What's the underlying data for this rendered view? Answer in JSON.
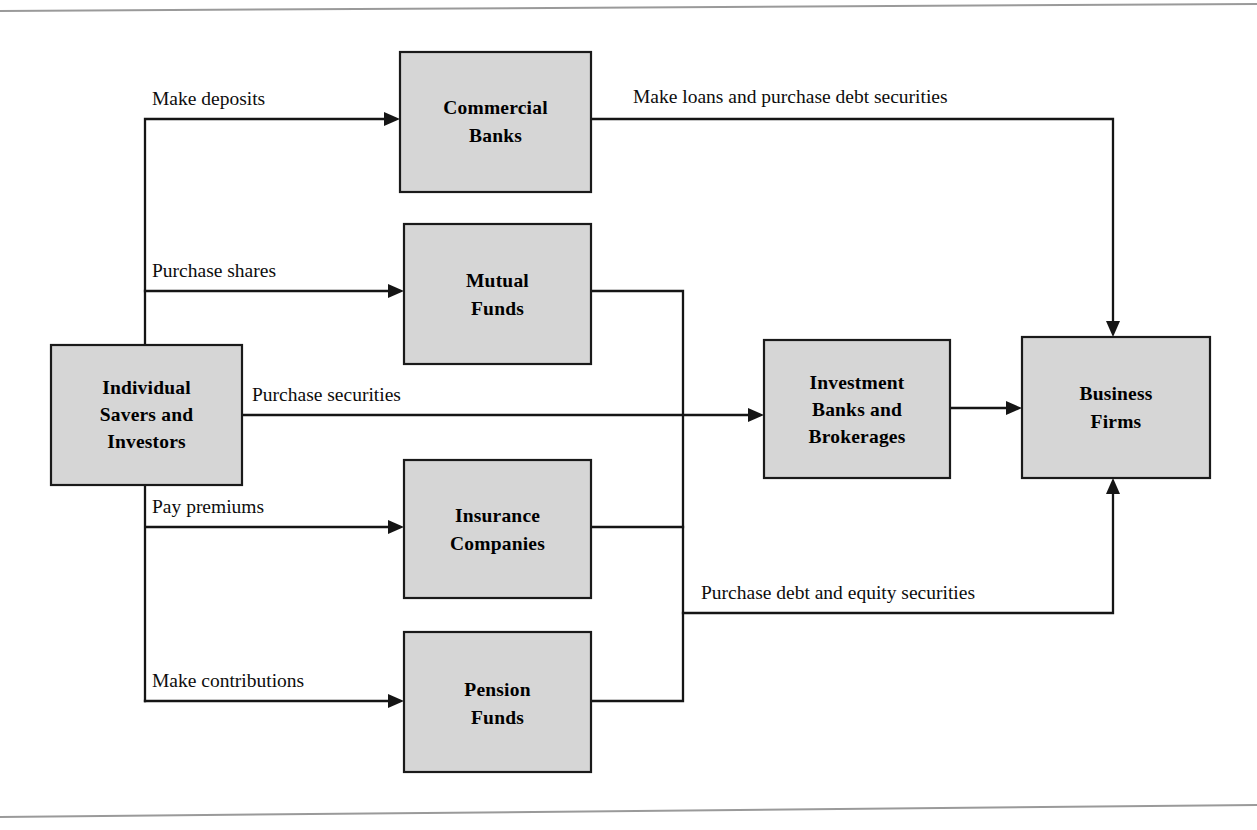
{
  "figure": {
    "kind": "flow-diagram",
    "box_fill_color": "#d6d6d6",
    "line_color": "#151515",
    "page_rule_color": "#9a9a9a"
  },
  "nodes": {
    "savers": {
      "id": "savers",
      "lines": [
        "Individual",
        "Savers and",
        "Investors"
      ],
      "x": 51,
      "y": 345,
      "w": 191,
      "h": 140
    },
    "commercial_banks": {
      "id": "commercial_banks",
      "lines": [
        "Commercial",
        "Banks"
      ],
      "x": 400,
      "y": 52,
      "w": 191,
      "h": 140
    },
    "mutual_funds": {
      "id": "mutual_funds",
      "lines": [
        "Mutual",
        "Funds"
      ],
      "x": 404,
      "y": 224,
      "w": 187,
      "h": 140
    },
    "insurance_companies": {
      "id": "insurance_companies",
      "lines": [
        "Insurance",
        "Companies"
      ],
      "x": 404,
      "y": 460,
      "w": 187,
      "h": 138
    },
    "pension_funds": {
      "id": "pension_funds",
      "lines": [
        "Pension",
        "Funds"
      ],
      "x": 404,
      "y": 632,
      "w": 187,
      "h": 140
    },
    "investment_banks": {
      "id": "investment_banks",
      "lines": [
        "Investment",
        "Banks and",
        "Brokerages"
      ],
      "x": 764,
      "y": 340,
      "w": 186,
      "h": 138
    },
    "business_firms": {
      "id": "business_firms",
      "lines": [
        "Business",
        "Firms"
      ],
      "x": 1022,
      "y": 337,
      "w": 188,
      "h": 141
    }
  },
  "edges": [
    {
      "id": "make-deposits",
      "label": "Make deposits",
      "from": "savers",
      "to": "commercial_banks",
      "label_x": 152,
      "label_y": 105
    },
    {
      "id": "purchase-shares",
      "label": "Purchase shares",
      "from": "savers",
      "to": "mutual_funds",
      "label_x": 152,
      "label_y": 277
    },
    {
      "id": "purchase-securities",
      "label": "Purchase securities",
      "from": "savers",
      "to": "investment_banks",
      "label_x": 252,
      "label_y": 401
    },
    {
      "id": "pay-premiums",
      "label": "Pay premiums",
      "from": "savers",
      "to": "insurance_companies",
      "label_x": 152,
      "label_y": 513
    },
    {
      "id": "make-contributions",
      "label": "Make contributions",
      "from": "savers",
      "to": "pension_funds",
      "label_x": 152,
      "label_y": 687
    },
    {
      "id": "make-loans",
      "label": "Make loans and purchase debt securities",
      "from": "commercial_banks",
      "to": "business_firms",
      "label_x": 633,
      "label_y": 103
    },
    {
      "id": "purchase-debt-equity",
      "label": "Purchase debt and equity securities",
      "from": "intermediaries-bus",
      "to": "business_firms",
      "label_x": 701,
      "label_y": 599
    },
    {
      "id": "investment-banks-to-firms",
      "label": "",
      "from": "investment_banks",
      "to": "business_firms",
      "label_x": 0,
      "label_y": 0
    }
  ]
}
